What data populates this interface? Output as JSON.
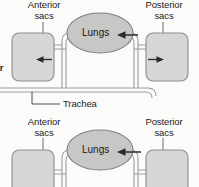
{
  "figure": {
    "colors": {
      "sac_fill": "#d6d6d4",
      "sac_stroke": "#8d8d8b",
      "lung_fill": "#c7c7c5",
      "lung_stroke": "#7e7e7c",
      "tube_fill": "#f2f2f0",
      "tube_stroke": "#9b9b99",
      "arrow": "#2a2a2a",
      "text": "#1d1d1d",
      "leader": "#5d5d5b",
      "background": "#fbfbfa"
    },
    "panels": [
      {
        "id": "panel-top",
        "name": "inhalation-phase",
        "labels": {
          "anterior_sacs_line1": "Anterior",
          "anterior_sacs_line2": "sacs",
          "posterior_sacs_line1": "Posterior",
          "posterior_sacs_line2": "sacs",
          "lungs": "Lungs",
          "trachea": "Trachea"
        },
        "arrows": [
          {
            "name": "arrow-into-anterior-sac",
            "direction": "left"
          },
          {
            "name": "arrow-into-lungs",
            "direction": "left"
          },
          {
            "name": "arrow-into-posterior-sac",
            "direction": "right"
          }
        ]
      },
      {
        "id": "panel-bottom",
        "name": "exhalation-phase",
        "labels": {
          "anterior_sacs_line1": "Anterior",
          "anterior_sacs_line2": "sacs",
          "posterior_sacs_line1": "Posterior",
          "posterior_sacs_line2": "sacs",
          "lungs": "Lungs"
        },
        "arrows": [
          {
            "name": "arrow-into-lungs",
            "direction": "left"
          }
        ]
      }
    ],
    "cropped_text": {
      "left_edge_fragment": "or"
    }
  }
}
